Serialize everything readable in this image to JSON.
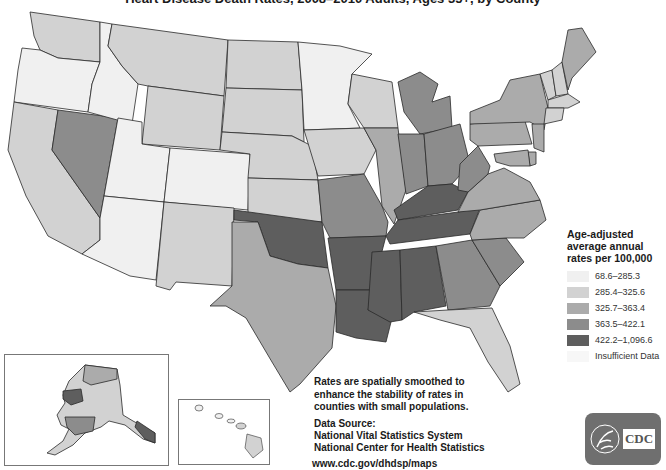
{
  "title": "Heart Disease Death Rates, 2008–2010 Adults, Ages 35+, by County",
  "legend": {
    "title_lines": [
      "Age-adjusted",
      "average annual",
      "rates per 100,000"
    ],
    "classes": [
      {
        "label": "68.6–285.3",
        "color": "#f0f0f0"
      },
      {
        "label": "285.4–325.6",
        "color": "#d2d2d2"
      },
      {
        "label": "325.7–363.4",
        "color": "#ababab"
      },
      {
        "label": "363.5–422.1",
        "color": "#8c8c8c"
      },
      {
        "label": "422.2–1,096.6",
        "color": "#5e5e5e"
      },
      {
        "label": "Insufficient Data",
        "color": "#f7f7f7"
      }
    ]
  },
  "note": "Rates are spatially smoothed to enhance the stability of rates in counties with small populations.",
  "source": {
    "heading": "Data Source:",
    "lines": [
      "National Vital Statistics System",
      "National Center for Health Statistics"
    ]
  },
  "url": "www.cdc.gov/dhdsp/maps",
  "logo": {
    "text": "CDC"
  },
  "regions": {
    "WA": 1,
    "OR": 0,
    "CA": 1,
    "NV": 3,
    "ID": 0,
    "MT": 1,
    "WY": 1,
    "UT": 0,
    "AZ": 0,
    "CO": 0,
    "NM": 1,
    "ND": 1,
    "SD": 1,
    "NE": 1,
    "KS": 1,
    "OK": 4,
    "TX": 2,
    "MN": 0,
    "IA": 1,
    "MO": 3,
    "AR": 4,
    "LA": 4,
    "WI": 1,
    "IL": 2,
    "MS": 4,
    "MI": 3,
    "IN": 3,
    "OH": 3,
    "KY": 4,
    "TN": 4,
    "AL": 4,
    "GA": 3,
    "FL": 1,
    "SC": 3,
    "NC": 2,
    "VA": 2,
    "WV": 3,
    "PA": 2,
    "NY": 2,
    "VT": 1,
    "NH": 1,
    "ME": 2,
    "MA": 1,
    "CT": 1,
    "NJ": 2,
    "DE": 2,
    "MD": 2,
    "AK": 1,
    "HI": 1
  }
}
